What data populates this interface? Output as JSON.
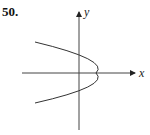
{
  "problem_number": "50.",
  "axes": {
    "x_label": "x",
    "y_label": "y"
  },
  "curve": {
    "type": "parabola",
    "opens": "left",
    "stroke": "#333333"
  }
}
